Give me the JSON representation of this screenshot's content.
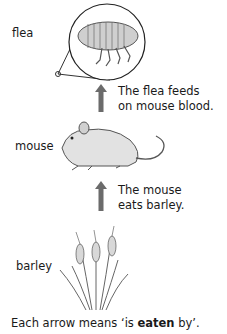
{
  "diagram": {
    "type": "food-chain",
    "organisms": [
      {
        "id": "flea",
        "label": "flea"
      },
      {
        "id": "mouse",
        "label": "mouse"
      },
      {
        "id": "barley",
        "label": "barley"
      }
    ],
    "arrows": [
      {
        "from": "mouse",
        "to": "flea",
        "note_line1": "The flea feeds",
        "note_line2": "on mouse blood."
      },
      {
        "from": "barley",
        "to": "mouse",
        "note_line1": "The mouse",
        "note_line2": "eats barley."
      }
    ],
    "caption": {
      "prefix": "Each arrow means ‘is ",
      "bold": "eaten",
      "suffix": " by’."
    },
    "colors": {
      "arrow": "#6b6b6b",
      "text": "#1a1a1a",
      "drawing": "#555555"
    }
  }
}
